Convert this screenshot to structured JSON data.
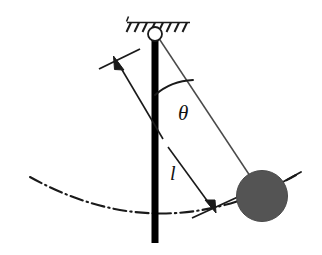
{
  "figure": {
    "title": "simple-pendulum-diagram",
    "background_color": "#ffffff",
    "width": 322,
    "height": 255
  },
  "labels": {
    "angle_symbol": "θ",
    "length_symbol": "l"
  },
  "colors": {
    "ink": "#1a1a1a",
    "bob_fill": "#545454",
    "bob_stroke": "#3d3d3d",
    "rod_fill": "#000000",
    "pivot_fill": "#ffffff",
    "thin_line": "#555555"
  },
  "elements": {
    "ceiling_label": "hatched-support",
    "pivot_label": "pivot-joint",
    "rod_label": "vertical-reference-rod",
    "string_label": "pendulum-string",
    "bob_label": "pendulum-bob",
    "arc_label": "swing-path-arc",
    "angle_arc_label": "angle-arc",
    "dimension_label": "length-dimension-arrow"
  },
  "geometry": {
    "pivot": {
      "x": 155,
      "y": 34,
      "r": 7
    },
    "ceiling": {
      "x1": 127,
      "x2": 190,
      "y": 22,
      "hatch_count": 8
    },
    "rod": {
      "x": 155,
      "y_top": 34,
      "y_bottom": 243,
      "width": 7
    },
    "bob": {
      "cx": 262,
      "cy": 196,
      "r": 25
    },
    "string": {
      "x1": 158,
      "y1": 38,
      "x2": 252,
      "y2": 180
    },
    "angle_arc": {
      "radius": 58,
      "start_deg": -90,
      "end_deg": -56
    },
    "arc_path": {
      "start_x": 30,
      "start_y": 177,
      "end_x": 295,
      "end_y": 176
    },
    "dim_arrow_top": {
      "x": 113,
      "y": 57
    },
    "dim_arrow_bottom": {
      "x": 215,
      "y": 210
    },
    "theta_label_pos": {
      "x": 178,
      "y": 113
    },
    "l_label_pos": {
      "x": 172,
      "y": 172
    }
  }
}
